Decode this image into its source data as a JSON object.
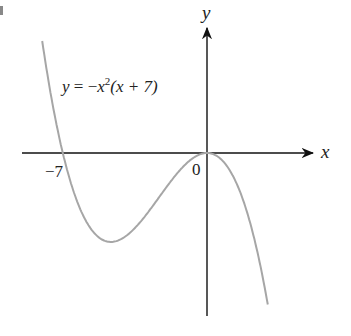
{
  "chart_data": {
    "type": "line",
    "title": "",
    "equation_label": "y = −x²(x + 7)",
    "equation_parts": {
      "lhs": "y",
      "eq": " = −",
      "x": "x",
      "exp": "2",
      "rest": "(x + 7)"
    },
    "xlabel": "x",
    "ylabel": "y",
    "tick_labels": {
      "x_intercept": "−7",
      "origin": "0"
    },
    "x_intercepts": [
      -7,
      0
    ],
    "local_min": {
      "x": -4.67,
      "y": -50.8
    },
    "local_max": {
      "x": 0,
      "y": 0
    },
    "series": [
      {
        "name": "y = -x^2(x+7)",
        "color": "#a6a6a6",
        "x": [
          -8.5,
          -8,
          -7.5,
          -7,
          -6.5,
          -6,
          -5.5,
          -5,
          -4.67,
          -4,
          -3.5,
          -3,
          -2.5,
          -2,
          -1.5,
          -1,
          -0.5,
          0,
          0.5,
          1,
          1.5,
          2,
          2.5,
          2.9
        ],
        "y": [
          108.4,
          64,
          28.1,
          0,
          -21.1,
          -36,
          -45.4,
          -50,
          -50.8,
          -48,
          -42.9,
          -36,
          -28.1,
          -20,
          -12.4,
          -6,
          -1.6,
          0,
          -1.9,
          -8,
          -19.1,
          -36,
          -59.4,
          -84.1
        ]
      }
    ],
    "grid": false,
    "legend": "none",
    "axis_color": "#111111"
  }
}
